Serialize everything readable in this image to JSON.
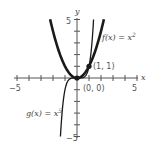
{
  "chart_data": {
    "type": "line",
    "title": "",
    "xlabel": "x",
    "ylabel": "y",
    "xlim": [
      -5,
      5
    ],
    "ylim": [
      -5,
      5
    ],
    "grid": false,
    "x_tick_labels": [
      "-5",
      "5"
    ],
    "y_tick_labels": [
      "5",
      "-5"
    ],
    "series": [
      {
        "name": "f(x) = x^2",
        "label": "f(x) = x",
        "exponent": 2,
        "style": "bold",
        "x_range": [
          -2.24,
          2.24
        ]
      },
      {
        "name": "g(x) = x^5",
        "label": "g(x) = x",
        "exponent": 5,
        "style": "thin",
        "x_range": [
          -1.38,
          1.38
        ]
      }
    ],
    "points": [
      {
        "x": 0,
        "y": 0,
        "label": "(0, 0)"
      },
      {
        "x": 1,
        "y": 1,
        "label": "(1, 1)"
      }
    ]
  },
  "labels": {
    "x_axis": "x",
    "y_axis": "y",
    "x_min": "−5",
    "x_max": "5",
    "y_max": "5",
    "y_min": "−5",
    "f_label": "f(x) = x",
    "f_exp": "2",
    "g_label": "g(x) = x",
    "g_exp": "5",
    "pt_origin": "(0, 0)",
    "pt_one": "(1, 1)"
  },
  "colors": {
    "axis": "#555555",
    "curve": "#1a1a1a",
    "background": "#ffffff"
  }
}
